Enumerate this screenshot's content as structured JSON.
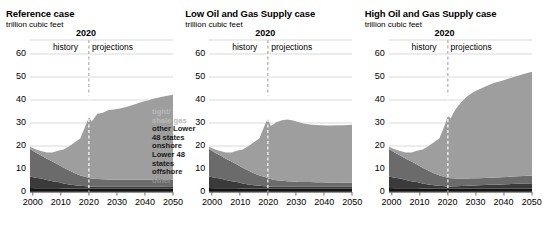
{
  "figure": {
    "units_label": "trillion cubic feet",
    "divider_year_label": "2020",
    "history_label": "history",
    "projections_label": "projections",
    "y_ticks": [
      "0",
      "10",
      "20",
      "30",
      "40",
      "50",
      "60"
    ],
    "x_ticks": [
      "2000",
      "2010",
      "2020",
      "2030",
      "2040",
      "2050"
    ],
    "legend": {
      "tight_shale_line1": "tight/",
      "tight_shale_line2": "shale gas",
      "other_l48_line1": "other Lower",
      "other_l48_line2": "48 states",
      "other_l48_line3": "onshore",
      "offshore_line1": "Lower 48",
      "offshore_line2": "states",
      "offshore_line3": "offshore",
      "other_line1": "other"
    },
    "colors": {
      "tight_shale": "#9e9e9e",
      "other_onshore": "#6b6b6b",
      "offshore": "#3a3a3a",
      "other": "#141414",
      "grid": "#c8c8c8",
      "axis": "#6e6e6e",
      "divider": "#9a9a9a"
    }
  },
  "chart_data": [
    {
      "type": "area",
      "title": "Reference case",
      "ylabel": "trillion cubic feet",
      "xlabel": "",
      "ylim": [
        0,
        60
      ],
      "xlim": [
        1999,
        2050
      ],
      "grid": true,
      "legend_position": "inside-right",
      "divider_x": 2020,
      "x": [
        1999,
        2001,
        2003,
        2005,
        2007,
        2009,
        2011,
        2013,
        2015,
        2017,
        2019,
        2020,
        2021,
        2022,
        2023,
        2025,
        2027,
        2029,
        2031,
        2033,
        2035,
        2037,
        2039,
        2041,
        2043,
        2045,
        2047,
        2050
      ],
      "series": [
        {
          "name": "other",
          "values": [
            1.7,
            1.6,
            1.6,
            1.6,
            1.6,
            1.6,
            1.5,
            1.5,
            1.4,
            1.4,
            1.4,
            1.4,
            1.4,
            1.4,
            1.4,
            1.4,
            1.4,
            1.4,
            1.4,
            1.4,
            1.4,
            1.4,
            1.4,
            1.4,
            1.4,
            1.4,
            1.4,
            1.4
          ]
        },
        {
          "name": "Lower 48 states offshore",
          "values": [
            5.0,
            4.6,
            4.3,
            3.6,
            3.1,
            2.7,
            2.2,
            1.8,
            1.5,
            1.3,
            1.1,
            1.0,
            1.0,
            1.0,
            1.0,
            1.0,
            1.0,
            1.0,
            1.0,
            1.0,
            1.0,
            1.0,
            1.0,
            1.0,
            1.0,
            1.0,
            1.0,
            1.1
          ]
        },
        {
          "name": "other Lower 48 states onshore",
          "values": [
            12.0,
            11.0,
            10.0,
            9.3,
            8.6,
            7.7,
            6.8,
            6.0,
            5.2,
            4.5,
            4.0,
            3.7,
            3.5,
            3.4,
            3.3,
            3.1,
            3.0,
            2.9,
            2.9,
            2.9,
            2.9,
            2.9,
            2.9,
            2.9,
            2.9,
            2.9,
            2.9,
            2.9
          ]
        },
        {
          "name": "tight/shale gas",
          "values": [
            1.0,
            1.4,
            1.9,
            2.7,
            3.9,
            5.9,
            8.0,
            10.6,
            13.5,
            16.2,
            23.0,
            26.4,
            24.6,
            26.5,
            28.3,
            29.0,
            30.2,
            30.6,
            31.0,
            31.6,
            32.3,
            33.1,
            33.9,
            34.5,
            35.2,
            35.8,
            36.3,
            36.9
          ]
        }
      ],
      "totals_note": {
        "2000": 19.5,
        "2020": 32.5,
        "2050": 42.3
      }
    },
    {
      "type": "area",
      "title": "Low Oil and Gas Supply case",
      "ylabel": "trillion cubic feet",
      "xlabel": "",
      "ylim": [
        0,
        60
      ],
      "xlim": [
        1999,
        2050
      ],
      "grid": true,
      "legend_position": "none",
      "divider_x": 2020,
      "x": [
        1999,
        2001,
        2003,
        2005,
        2007,
        2009,
        2011,
        2013,
        2015,
        2017,
        2019,
        2020,
        2021,
        2022,
        2023,
        2025,
        2027,
        2029,
        2031,
        2033,
        2035,
        2037,
        2039,
        2041,
        2043,
        2045,
        2047,
        2050
      ],
      "series": [
        {
          "name": "other",
          "values": [
            1.7,
            1.6,
            1.6,
            1.6,
            1.6,
            1.6,
            1.5,
            1.5,
            1.4,
            1.4,
            1.4,
            1.4,
            1.4,
            1.4,
            1.4,
            1.4,
            1.4,
            1.4,
            1.4,
            1.4,
            1.4,
            1.4,
            1.4,
            1.4,
            1.4,
            1.4,
            1.4,
            1.4
          ]
        },
        {
          "name": "Lower 48 states offshore",
          "values": [
            5.0,
            4.6,
            4.3,
            3.6,
            3.1,
            2.7,
            2.2,
            1.8,
            1.5,
            1.3,
            1.1,
            1.0,
            1.0,
            1.0,
            1.0,
            1.0,
            1.0,
            1.0,
            0.9,
            0.9,
            0.9,
            0.9,
            0.9,
            0.9,
            0.9,
            0.9,
            0.9,
            0.9
          ]
        },
        {
          "name": "other Lower 48 states onshore",
          "values": [
            12.0,
            11.0,
            10.0,
            9.3,
            8.6,
            7.7,
            6.8,
            6.0,
            5.2,
            4.5,
            4.0,
            3.6,
            3.2,
            2.9,
            2.7,
            2.5,
            2.3,
            2.2,
            2.1,
            2.0,
            2.0,
            1.9,
            1.9,
            1.8,
            1.8,
            1.8,
            1.7,
            1.7
          ]
        },
        {
          "name": "tight/shale gas",
          "values": [
            1.0,
            1.4,
            1.9,
            2.7,
            3.9,
            5.9,
            8.0,
            10.6,
            13.5,
            16.2,
            23.0,
            26.0,
            23.2,
            24.0,
            25.2,
            26.3,
            26.8,
            26.5,
            25.9,
            25.4,
            25.1,
            24.9,
            24.8,
            24.8,
            24.8,
            24.9,
            25.0,
            25.2
          ]
        }
      ],
      "totals_note": {
        "2000": 19.4,
        "2020": 32.0,
        "2050": 29.2
      }
    },
    {
      "type": "area",
      "title": "High Oil and Gas Supply case",
      "ylabel": "trillion cubic feet",
      "xlabel": "",
      "ylim": [
        0,
        60
      ],
      "xlim": [
        1999,
        2050
      ],
      "grid": true,
      "legend_position": "none",
      "divider_x": 2020,
      "x": [
        1999,
        2001,
        2003,
        2005,
        2007,
        2009,
        2011,
        2013,
        2015,
        2017,
        2019,
        2020,
        2021,
        2022,
        2023,
        2025,
        2027,
        2029,
        2031,
        2033,
        2035,
        2037,
        2039,
        2041,
        2043,
        2045,
        2047,
        2050
      ],
      "series": [
        {
          "name": "other",
          "values": [
            1.7,
            1.6,
            1.6,
            1.6,
            1.6,
            1.6,
            1.5,
            1.5,
            1.4,
            1.4,
            1.4,
            1.4,
            1.4,
            1.4,
            1.4,
            1.4,
            1.4,
            1.4,
            1.4,
            1.4,
            1.4,
            1.4,
            1.4,
            1.4,
            1.4,
            1.4,
            1.4,
            1.4
          ]
        },
        {
          "name": "Lower 48 states offshore",
          "values": [
            5.0,
            4.6,
            4.3,
            3.6,
            3.1,
            2.7,
            2.2,
            1.8,
            1.5,
            1.3,
            1.1,
            1.0,
            1.0,
            1.1,
            1.1,
            1.2,
            1.3,
            1.4,
            1.5,
            1.6,
            1.7,
            1.8,
            1.9,
            2.0,
            2.1,
            2.2,
            2.3,
            2.4
          ]
        },
        {
          "name": "other Lower 48 states onshore",
          "values": [
            12.0,
            11.0,
            10.0,
            9.3,
            8.6,
            7.7,
            6.8,
            6.0,
            5.2,
            4.5,
            4.0,
            3.8,
            3.6,
            3.5,
            3.4,
            3.3,
            3.2,
            3.2,
            3.1,
            3.1,
            3.1,
            3.1,
            3.1,
            3.1,
            3.2,
            3.2,
            3.3,
            3.4
          ]
        },
        {
          "name": "tight/shale gas",
          "values": [
            1.0,
            1.4,
            1.9,
            2.7,
            3.9,
            5.9,
            8.0,
            10.6,
            13.5,
            16.2,
            23.0,
            27.0,
            26.0,
            28.5,
            30.5,
            33.5,
            35.8,
            37.4,
            38.6,
            39.6,
            40.5,
            41.3,
            41.9,
            42.5,
            43.1,
            43.7,
            44.3,
            45.1
          ]
        }
      ],
      "totals_note": {
        "2000": 19.5,
        "2020": 33.2,
        "2050": 52.3
      }
    }
  ]
}
